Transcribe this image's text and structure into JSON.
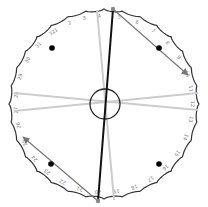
{
  "diagram": {
    "type": "circular-dial",
    "center": [
      104,
      104
    ],
    "radius": 95,
    "rim_color": "#333333",
    "numbers": [
      "1",
      "2",
      "3",
      "4",
      "5",
      "6",
      "7",
      "8",
      "9",
      "10",
      "11",
      "12",
      "13",
      "14",
      "15",
      "16",
      "17",
      "18",
      "19",
      "20",
      "21",
      "22",
      "23",
      "24",
      "25",
      "26",
      "27",
      "28",
      "29",
      "30",
      "31",
      "32"
    ],
    "number_angles_deg": [
      -123,
      -113,
      -103,
      -93,
      -80,
      -68,
      -56,
      -44,
      -32,
      -20,
      -10,
      0,
      10,
      22,
      34,
      46,
      58,
      70,
      82,
      94,
      106,
      118,
      130,
      142,
      154,
      166,
      176,
      186,
      198,
      210,
      222,
      234
    ],
    "hub": {
      "cx": 105,
      "cy": 104,
      "r": 15,
      "color": "#222222"
    },
    "light_lines": [
      {
        "x1": 97,
        "y1": 10,
        "x2": 114,
        "y2": 200,
        "color": "#cccccc"
      },
      {
        "x1": 14,
        "y1": 93,
        "x2": 198,
        "y2": 110,
        "color": "#cccccc"
      },
      {
        "x1": 14,
        "y1": 111,
        "x2": 198,
        "y2": 93,
        "color": "#cccccc"
      }
    ],
    "dark_line": {
      "x1": 113,
      "y1": 9,
      "x2": 98,
      "y2": 201,
      "color": "#111111"
    },
    "arrows": [
      {
        "x1": 113,
        "y1": 9,
        "x2": 188,
        "y2": 75,
        "color": "#777777"
      },
      {
        "x1": 98,
        "y1": 201,
        "x2": 23,
        "y2": 137,
        "color": "#777777"
      }
    ],
    "endpoints": [
      {
        "cx": 113,
        "cy": 9,
        "color": "#888888"
      },
      {
        "cx": 98,
        "cy": 201,
        "color": "#888888"
      }
    ],
    "dots": [
      {
        "cx": 52,
        "cy": 48
      },
      {
        "cx": 159,
        "cy": 48
      },
      {
        "cx": 51,
        "cy": 164
      },
      {
        "cx": 159,
        "cy": 164
      }
    ]
  }
}
